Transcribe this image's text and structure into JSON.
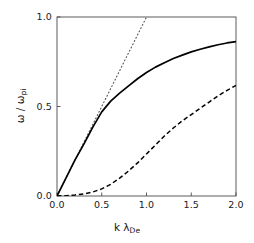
{
  "chart_data": {
    "type": "line",
    "title": "",
    "subtitle": "",
    "xlabel": "k λ_De",
    "ylabel": "ω / ω_pi",
    "xlabel_parts": {
      "base": "k λ",
      "sub": "De"
    },
    "ylabel_parts": {
      "numerator": "ω",
      "slash": "/",
      "denominator": "ω",
      "denominator_sub": "pi"
    },
    "xlim": [
      0.0,
      2.0
    ],
    "ylim": [
      0.0,
      1.0
    ],
    "xticks": [
      0.0,
      0.5,
      1.0,
      1.5,
      2.0
    ],
    "xtick_labels": [
      "0.0",
      "0.5",
      "1.0",
      "1.5",
      "2.0"
    ],
    "yticks": [
      0.0,
      0.5,
      1.0
    ],
    "ytick_labels": [
      "0.0",
      "0.5",
      "1.0"
    ],
    "grid": false,
    "legend": "none",
    "frame": "box",
    "background_color": "#ffffff",
    "line_color": "#000000",
    "series": [
      {
        "name": "dotted-straight-line",
        "style": "dotted",
        "color": "#555555",
        "x": [
          0.0,
          0.1,
          0.2,
          0.3,
          0.4,
          0.5,
          0.6,
          0.7,
          0.8,
          0.9,
          1.0
        ],
        "values": [
          0.0,
          0.1,
          0.2,
          0.3,
          0.4,
          0.5,
          0.6,
          0.7,
          0.8,
          0.9,
          1.0
        ]
      },
      {
        "name": "solid-upper-branch",
        "style": "solid",
        "color": "#000000",
        "x": [
          0.0,
          0.1,
          0.2,
          0.3,
          0.4,
          0.5,
          0.6,
          0.7,
          0.8,
          0.9,
          1.0,
          1.1,
          1.2,
          1.3,
          1.4,
          1.5,
          1.6,
          1.7,
          1.8,
          1.9,
          2.0
        ],
        "values": [
          0.0,
          0.1,
          0.2,
          0.29,
          0.385,
          0.47,
          0.53,
          0.575,
          0.615,
          0.655,
          0.69,
          0.72,
          0.745,
          0.768,
          0.787,
          0.805,
          0.82,
          0.833,
          0.845,
          0.855,
          0.862
        ]
      },
      {
        "name": "dashed-lower-branch",
        "style": "dashed",
        "color": "#000000",
        "x": [
          0.0,
          0.1,
          0.2,
          0.3,
          0.4,
          0.5,
          0.6,
          0.7,
          0.8,
          0.9,
          1.0,
          1.1,
          1.2,
          1.3,
          1.4,
          1.5,
          1.6,
          1.7,
          1.8,
          1.9,
          2.0
        ],
        "values": [
          0.0,
          0.002,
          0.006,
          0.012,
          0.022,
          0.04,
          0.065,
          0.1,
          0.14,
          0.185,
          0.235,
          0.285,
          0.335,
          0.38,
          0.42,
          0.455,
          0.49,
          0.525,
          0.56,
          0.59,
          0.618
        ]
      }
    ]
  }
}
